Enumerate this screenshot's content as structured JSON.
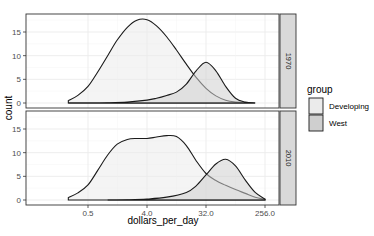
{
  "chart_data": {
    "type": "area",
    "subtype": "density (faceted, overlaid)",
    "title": "",
    "xlabel": "dollars_per_day",
    "ylabel": "count",
    "x_scale": "log2",
    "x_ticks": [
      0.5,
      4.0,
      32.0,
      256.0
    ],
    "x_tick_labels": [
      "0.5",
      "4.0",
      "32.0",
      "256.0"
    ],
    "y_ticks": [
      0,
      5,
      10,
      15
    ],
    "y_tick_labels": [
      "0",
      "5",
      "10",
      "15"
    ],
    "ylim": [
      0,
      18.5
    ],
    "grid": true,
    "legend": {
      "title": "group",
      "position": "right",
      "entries": [
        {
          "label": "Developing",
          "fill": "#ebebeb"
        },
        {
          "label": "West",
          "fill": "#cfcfcf"
        }
      ]
    },
    "facets": [
      {
        "label": "1970",
        "series": [
          {
            "name": "Developing",
            "x": [
              0.25,
              0.35,
              0.5,
              0.7,
              1.0,
              1.4,
              2.0,
              2.8,
              4.0,
              5.6,
              8.0,
              11.3,
              16.0,
              22.6,
              32.0,
              45.3,
              64.0,
              90.5,
              128.0,
              181.0
            ],
            "values": [
              0.5,
              1.6,
              3.5,
              6.5,
              10.0,
              13.3,
              16.0,
              17.5,
              17.6,
              16.3,
              14.0,
              11.2,
              8.2,
              5.4,
              3.1,
              1.5,
              0.6,
              0.2,
              0.05,
              0.0
            ]
          },
          {
            "name": "West",
            "x": [
              0.25,
              0.5,
              1.0,
              2.0,
              4.0,
              5.6,
              8.0,
              11.3,
              16.0,
              22.6,
              32.0,
              45.3,
              64.0,
              90.5,
              128.0,
              181.0
            ],
            "values": [
              0.0,
              0.0,
              0.05,
              0.2,
              0.6,
              1.0,
              1.6,
              2.3,
              4.0,
              6.8,
              8.6,
              6.8,
              3.5,
              1.0,
              0.2,
              0.0
            ]
          }
        ]
      },
      {
        "label": "2010",
        "series": [
          {
            "name": "Developing",
            "x": [
              0.25,
              0.35,
              0.5,
              0.7,
              1.0,
              1.4,
              2.0,
              2.8,
              4.0,
              5.6,
              8.0,
              11.3,
              16.0,
              22.6,
              32.0,
              45.3,
              64.0,
              90.5,
              128.0,
              181.0,
              256.0
            ],
            "values": [
              0.5,
              1.5,
              3.2,
              6.2,
              9.5,
              11.8,
              12.8,
              13.0,
              13.0,
              13.3,
              13.6,
              13.4,
              11.5,
              8.3,
              5.6,
              4.1,
              3.1,
              2.2,
              1.4,
              0.6,
              0.1
            ]
          },
          {
            "name": "West",
            "x": [
              1.0,
              2.0,
              4.0,
              8.0,
              16.0,
              22.6,
              32.0,
              45.3,
              64.0,
              90.5,
              128.0,
              181.0,
              256.0
            ],
            "values": [
              0.0,
              0.05,
              0.2,
              0.6,
              1.6,
              3.0,
              5.3,
              7.6,
              8.6,
              7.2,
              4.2,
              1.6,
              0.2
            ]
          }
        ]
      }
    ]
  },
  "ui": {
    "colors": {
      "developing_fill": "#ebebeb",
      "west_fill": "#cfcfcf",
      "line": "#1a1a1a",
      "strip_bg": "#d9d9d9",
      "panel_border": "#333333",
      "grid": "#ebebeb"
    }
  }
}
